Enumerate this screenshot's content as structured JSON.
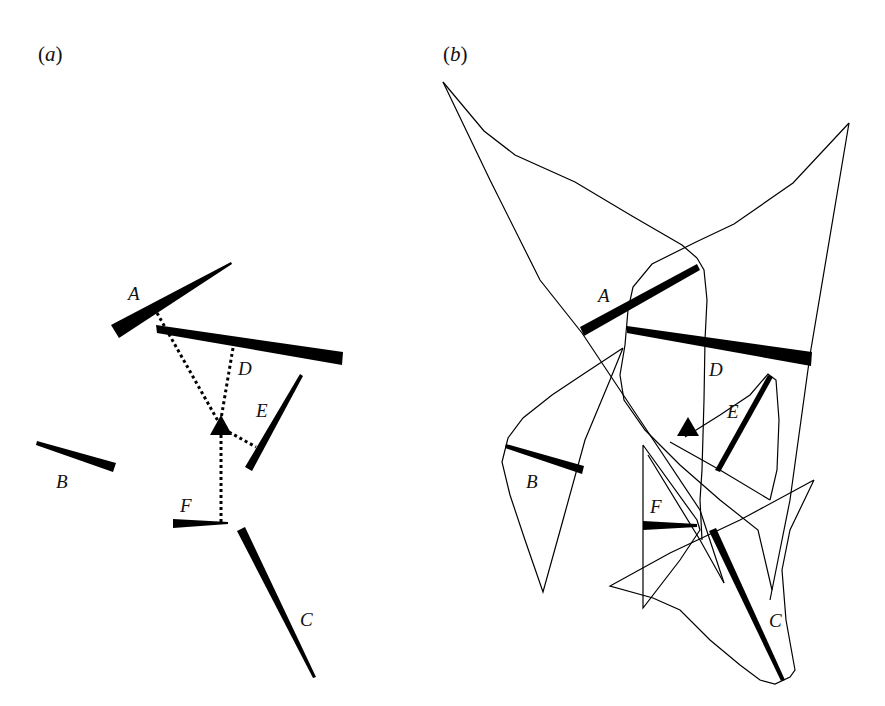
{
  "figure": {
    "panels": [
      {
        "id": "a",
        "label_open": "(",
        "label_letter": "a",
        "label_close": ")",
        "segments": [
          {
            "name": "A",
            "label": "A"
          },
          {
            "name": "B",
            "label": "B"
          },
          {
            "name": "C",
            "label": "C"
          },
          {
            "name": "D",
            "label": "D"
          },
          {
            "name": "E",
            "label": "E"
          },
          {
            "name": "F",
            "label": "F"
          }
        ],
        "agent": "triangle",
        "sight_lines": [
          "A",
          "D",
          "E",
          "F"
        ]
      },
      {
        "id": "b",
        "label_open": "(",
        "label_letter": "b",
        "label_close": ")",
        "segments": [
          {
            "name": "A",
            "label": "A"
          },
          {
            "name": "B",
            "label": "B"
          },
          {
            "name": "C",
            "label": "C"
          },
          {
            "name": "D",
            "label": "D"
          },
          {
            "name": "E",
            "label": "E"
          },
          {
            "name": "F",
            "label": "F"
          }
        ],
        "agent": "triangle",
        "outline": "thin polygonal outlines enclosing each segment"
      }
    ],
    "colors": {
      "ink": "#000000",
      "background": "#ffffff"
    }
  }
}
